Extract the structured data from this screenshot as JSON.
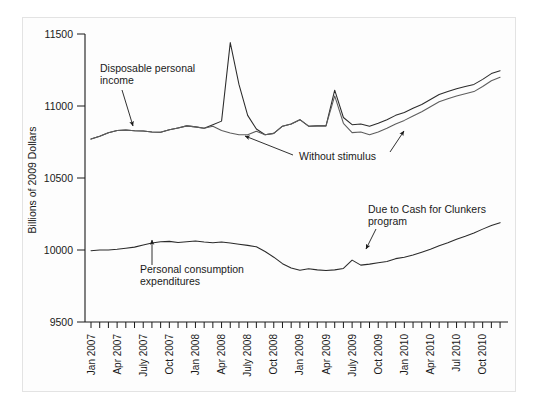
{
  "chart_data": {
    "type": "line",
    "title": "",
    "xlabel": "",
    "ylabel": "Billions of 2009 Dollars",
    "ylim": [
      9500,
      11500
    ],
    "yticks": [
      9500,
      10000,
      10500,
      11000,
      11500
    ],
    "ytick_labels": [
      "9500",
      "10000",
      "10500",
      "11000",
      "11500"
    ],
    "grid": false,
    "legend_position": "none",
    "xtick_labels": [
      "Jan 2007",
      "Apr 2007",
      "July 2007",
      "Oct 2007",
      "Jan 2008",
      "Apr 2008",
      "July 2008",
      "Oct 2008",
      "Jan 2009",
      "Apr 2009",
      "July 2009",
      "Oct 2009",
      "Jan 2010",
      "Apr 2010",
      "Jul 2010",
      "Oct 2010"
    ],
    "x": [
      "Jan 2007",
      "Feb 2007",
      "Mar 2007",
      "Apr 2007",
      "May 2007",
      "Jun 2007",
      "Jul 2007",
      "Aug 2007",
      "Sep 2007",
      "Oct 2007",
      "Nov 2007",
      "Dec 2007",
      "Jan 2008",
      "Feb 2008",
      "Mar 2008",
      "Apr 2008",
      "May 2008",
      "Jun 2008",
      "Jul 2008",
      "Aug 2008",
      "Sep 2008",
      "Oct 2008",
      "Nov 2008",
      "Dec 2008",
      "Jan 2009",
      "Feb 2009",
      "Mar 2009",
      "Apr 2009",
      "May 2009",
      "Jun 2009",
      "Jul 2009",
      "Aug 2009",
      "Sep 2009",
      "Oct 2009",
      "Nov 2009",
      "Dec 2009",
      "Jan 2010",
      "Feb 2010",
      "Mar 2010",
      "Apr 2010",
      "May 2010",
      "Jun 2010",
      "Jul 2010",
      "Aug 2010",
      "Sep 2010",
      "Oct 2010",
      "Nov 2010",
      "Dec 2010"
    ],
    "series": [
      {
        "name": "Disposable personal income",
        "values": [
          10770,
          10790,
          10815,
          10830,
          10833,
          10828,
          10826,
          10820,
          10818,
          10835,
          10848,
          10862,
          10855,
          10845,
          10870,
          10895,
          11440,
          11150,
          10935,
          10840,
          10800,
          10810,
          10860,
          10875,
          10905,
          10860,
          10862,
          10862,
          11110,
          10920,
          10870,
          10875,
          10860,
          10880,
          10905,
          10935,
          10955,
          10985,
          11010,
          11045,
          11080,
          11100,
          11120,
          11135,
          11150,
          11185,
          11225,
          11245
        ]
      },
      {
        "name": "Without stimulus",
        "values": [
          10770,
          10790,
          10815,
          10830,
          10833,
          10828,
          10826,
          10820,
          10818,
          10835,
          10848,
          10862,
          10855,
          10845,
          10860,
          10830,
          10812,
          10800,
          10800,
          10825,
          10800,
          10810,
          10860,
          10875,
          10905,
          10860,
          10862,
          10862,
          11070,
          10880,
          10815,
          10820,
          10800,
          10820,
          10845,
          10875,
          10900,
          10930,
          10960,
          10995,
          11030,
          11050,
          11070,
          11085,
          11100,
          11135,
          11175,
          11200
        ]
      },
      {
        "name": "Personal consumption expenditures",
        "values": [
          9995,
          10000,
          10000,
          10005,
          10012,
          10020,
          10035,
          10048,
          10058,
          10060,
          10052,
          10058,
          10062,
          10055,
          10050,
          10055,
          10048,
          10040,
          10032,
          10022,
          9990,
          9950,
          9905,
          9875,
          9860,
          9870,
          9862,
          9858,
          9862,
          9872,
          9930,
          9895,
          9902,
          9912,
          9920,
          9940,
          9950,
          9965,
          9985,
          10005,
          10030,
          10050,
          10075,
          10095,
          10118,
          10145,
          10170,
          10190
        ]
      }
    ],
    "annotations": [
      {
        "id": "disposable-personal-income",
        "text_lines": [
          "Disposable personal",
          "income"
        ],
        "text_x": 100,
        "text_y": 72,
        "arrow": {
          "x1": 122,
          "y1": 90,
          "x2": 133,
          "y2": 126
        }
      },
      {
        "id": "without-stimulus",
        "text_lines": [
          "Without stimulus"
        ],
        "text_x": 299,
        "text_y": 160,
        "arrow": {
          "x1": 293,
          "y1": 155,
          "x2": 245,
          "y2": 136
        },
        "arrow2": {
          "x1": 390,
          "y1": 152,
          "x2": 404,
          "y2": 131
        }
      },
      {
        "id": "personal-consumption-expenditures",
        "text_lines": [
          "Personal consumption",
          "expenditures"
        ],
        "text_x": 140,
        "text_y": 273,
        "arrow": {
          "x1": 152,
          "y1": 265,
          "x2": 152,
          "y2": 240
        }
      },
      {
        "id": "cash-for-clunkers",
        "text_lines": [
          "Due to Cash for Clunkers",
          "program"
        ],
        "text_x": 368,
        "text_y": 213,
        "arrow": {
          "x1": 376,
          "y1": 229,
          "x2": 366,
          "y2": 249
        }
      }
    ]
  }
}
